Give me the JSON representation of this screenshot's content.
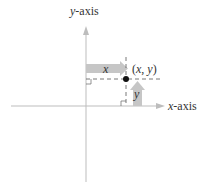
{
  "diagram": {
    "axes": {
      "y_axis": {
        "label_var": "y",
        "label_suffix": "-axis"
      },
      "x_axis": {
        "label_var": "x",
        "label_suffix": "-axis"
      }
    },
    "point": {
      "label_open": "(",
      "label_x": "x",
      "label_sep": ", ",
      "label_y": "y",
      "label_close": ")"
    },
    "arrows": {
      "x_distance_label": "x",
      "y_distance_label": "y"
    },
    "colors": {
      "axis": "#b8b8b8",
      "arrow_fill": "#c4c4c4",
      "dashed": "#444444",
      "point": "#111111",
      "text": "#333333"
    }
  }
}
